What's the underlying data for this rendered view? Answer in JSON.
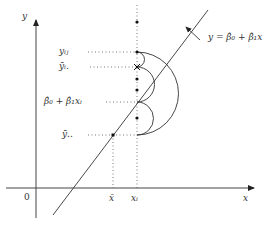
{
  "diagram": {
    "axes": {
      "y_label": "y",
      "x_label": "x",
      "origin_label": "0"
    },
    "x_ticks": {
      "x_bar": "x̄",
      "x_i": "xᵢ"
    },
    "y_levels": {
      "y_ij": "yᵢⱼ",
      "y_bar_i": "ȳᵢ.",
      "fitted": "β̂₀ + β̂₁xᵢ",
      "y_bar_bar": "ȳ.."
    },
    "line_label": "y = β̂₀ + β̂₁x",
    "colors": {
      "line": "#333333",
      "dotted": "#555555",
      "text": "#333333"
    }
  }
}
